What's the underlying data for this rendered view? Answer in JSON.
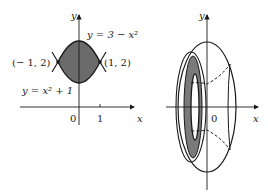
{
  "left_figure": {
    "axis_y_label": "y",
    "axis_x_label": "x",
    "origin_label": "0",
    "tick_label_1": "1",
    "upper_curve_label": "y = 3 − x²",
    "lower_curve_label": "y = x² + 1",
    "point_left_label": "(− 1, 2)",
    "point_right_label": "(1, 2)",
    "region_fill": "#6b6b6b"
  },
  "right_figure": {
    "axis_y_label": "y",
    "axis_x_label": "x",
    "origin_label": "0",
    "washer_fill": "#7a7a7a"
  },
  "colors": {
    "stroke": "#1a1a1a",
    "background": "#ffffff"
  }
}
